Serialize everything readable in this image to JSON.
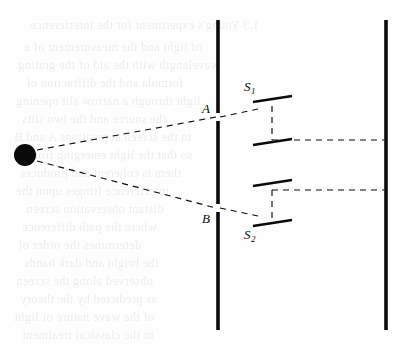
{
  "figure": {
    "type": "optics-ray-diagram",
    "background_color": "#fefefe",
    "ink_color": "#0a0a0a",
    "width": 407,
    "height": 349
  },
  "labels": {
    "source": {
      "text": "S",
      "x": 22,
      "y": 142
    },
    "slit_a": {
      "text": "A",
      "x": 202,
      "y": 102
    },
    "slit_b": {
      "text": "B",
      "x": 202,
      "y": 212
    },
    "secondary_1": {
      "text": "S",
      "sub": "1",
      "x": 244,
      "y": 80
    },
    "secondary_2": {
      "text": "S",
      "sub": "2",
      "x": 244,
      "y": 228
    }
  },
  "source_point": {
    "name": "point-source",
    "cx": 25,
    "cy": 155,
    "r": 11,
    "fill": "#0a0a0a"
  },
  "barriers": [
    {
      "name": "slit-barrier",
      "x": 218,
      "segments": [
        {
          "y1": 20,
          "y2": 113
        },
        {
          "y1": 121,
          "y2": 204
        },
        {
          "y1": 212,
          "y2": 330
        }
      ],
      "stroke_width": 3.6
    },
    {
      "name": "observation-screen",
      "x": 386,
      "segments": [
        {
          "y1": 20,
          "y2": 330
        }
      ],
      "stroke_width": 3.6
    }
  ],
  "rays": [
    {
      "name": "ray-source-to-a",
      "x1": 37,
      "y1": 150,
      "x2": 216,
      "y2": 117
    },
    {
      "name": "ray-a-to-s1",
      "x1": 220,
      "y1": 117,
      "x2": 258,
      "y2": 109
    },
    {
      "name": "ray-source-to-b",
      "x1": 37,
      "y1": 161,
      "x2": 216,
      "y2": 208
    },
    {
      "name": "ray-b-to-s2",
      "x1": 220,
      "y1": 208,
      "x2": 258,
      "y2": 216
    },
    {
      "name": "ray-s1-vertical",
      "x1": 272,
      "y1": 106,
      "x2": 272,
      "y2": 140
    },
    {
      "name": "ray-s2-vertical",
      "x1": 272,
      "y1": 190,
      "x2": 272,
      "y2": 221
    },
    {
      "name": "ray-upper-to-screen",
      "x1": 272,
      "y1": 140,
      "x2": 384,
      "y2": 140
    },
    {
      "name": "ray-lower-to-screen",
      "x1": 272,
      "y1": 190,
      "x2": 384,
      "y2": 190
    }
  ],
  "mirrors": [
    {
      "name": "mirror-s1-upper",
      "x1": 253,
      "y1": 102,
      "x2": 292,
      "y2": 96
    },
    {
      "name": "mirror-s1-lower",
      "x1": 253,
      "y1": 145,
      "x2": 292,
      "y2": 139
    },
    {
      "name": "mirror-s2-upper",
      "x1": 253,
      "y1": 186,
      "x2": 292,
      "y2": 180
    },
    {
      "name": "mirror-s2-lower",
      "x1": 253,
      "y1": 226,
      "x2": 292,
      "y2": 220
    }
  ],
  "dash_pattern": "6,5",
  "bleed_text": [
    {
      "text": "1.3 Young's experiment for the interference",
      "x": 30,
      "y": 18
    },
    {
      "text": "of light and the measurement of a",
      "x": 24,
      "y": 40
    },
    {
      "text": "wavelength with the aid of the grating",
      "x": 18,
      "y": 58
    },
    {
      "text": "formula and the diffraction of",
      "x": 26,
      "y": 76
    },
    {
      "text": "light through a narrow slit opening",
      "x": 16,
      "y": 94
    },
    {
      "text": "the source and the two slits",
      "x": 22,
      "y": 112
    },
    {
      "text": "in the screen at positions A and B",
      "x": 14,
      "y": 130
    },
    {
      "text": "so that the light emerging from",
      "x": 28,
      "y": 148
    },
    {
      "text": "them is coherent and produces",
      "x": 20,
      "y": 166
    },
    {
      "text": "interference fringes upon the",
      "x": 16,
      "y": 184
    },
    {
      "text": "distant observation screen",
      "x": 26,
      "y": 202
    },
    {
      "text": "where the path difference",
      "x": 22,
      "y": 220
    },
    {
      "text": "determines the order of",
      "x": 18,
      "y": 238
    },
    {
      "text": "the bright and dark bands",
      "x": 24,
      "y": 256
    },
    {
      "text": "observed along the screen",
      "x": 16,
      "y": 274
    },
    {
      "text": "as predicted by the theory",
      "x": 20,
      "y": 292
    },
    {
      "text": "of the wave nature of light",
      "x": 14,
      "y": 310
    },
    {
      "text": "in the classical treatment",
      "x": 22,
      "y": 328
    }
  ]
}
